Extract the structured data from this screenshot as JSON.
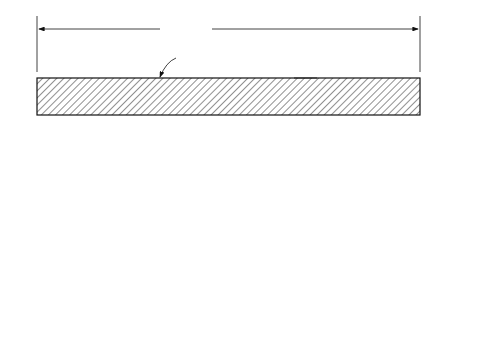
{
  "plates": {
    "width_label": "Width ≥ 8″",
    "rolled_surface_label": "Rolled surface",
    "thickness_label_line1": "Thickness ≥ 0.18″ or 0.23″,",
    "thickness_label_line2": "depending on",
    "thickness_label_line3": "plate width",
    "edge_label_line1_italic": "Cut edge",
    "edge_label_line1_rest": " (sheared or flame cut)",
    "edge_label_line2_pre": "or ",
    "edge_label_line2_italic": "Rolled edge",
    "edge_label_line2_rest": " (universal mill)",
    "caption": "(a) Plates"
  },
  "bars": {
    "diameter_label": "Diameter, ",
    "diameter_symbol": "d",
    "circular_label_line1": "Solid",
    "circular_label_line2": "circular",
    "width_label": "Width < 8″",
    "thickness_label_line1": "Thickness, up to",
    "thickness_label_line2": "0.203″ or 0.23″,",
    "thickness_label_line3": "dep. on width",
    "rect_label_line1": "Solid square",
    "rect_label_line2": "or rectangular",
    "hex_label": "Hexagonal",
    "caption": "(b) Bar products"
  }
}
